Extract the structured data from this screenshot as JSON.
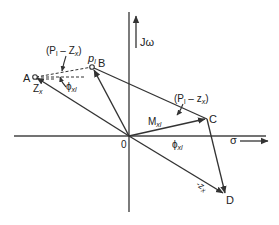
{
  "diagram": {
    "axes": {
      "vertical_label": "Jω",
      "horizontal_label": "σ",
      "origin_label": "0"
    },
    "points": {
      "A": "A",
      "B": "B",
      "C": "C",
      "D": "D"
    },
    "labels": {
      "pl_top": "(P",
      "pl_top_sub": "l",
      "pl_top_rest": " – Z",
      "pl_top_sub2": "x",
      "pl_top_close": ")",
      "pl_right": "(P",
      "pl_right_sub": "l",
      "pl_right_rest": " – z",
      "pl_right_sub2": "x",
      "pl_right_close": ")",
      "p_l": "p",
      "p_l_sub": "l",
      "z_x": "Z",
      "z_x_sub": "x",
      "phi_xl_left": "ϕ",
      "phi_xl_left_sub": "xl",
      "phi_xl_bottom": "ϕ",
      "phi_xl_bottom_sub": "xl",
      "m_xl": "M",
      "m_xl_sub": "xl",
      "neg_z_x": "-z",
      "neg_z_x_sub": "x"
    },
    "colors": {
      "line": "#333333",
      "background": "#ffffff"
    }
  }
}
